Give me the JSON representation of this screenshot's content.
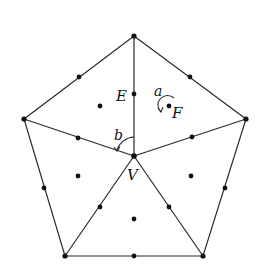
{
  "diagram": {
    "colors": {
      "line": "#2a2a2a",
      "dot": "#111111",
      "background": "#ffffff"
    },
    "outer_vertices": [
      {
        "x": 134,
        "y": 36
      },
      {
        "x": 246,
        "y": 119
      },
      {
        "x": 203,
        "y": 256
      },
      {
        "x": 65,
        "y": 256
      },
      {
        "x": 24,
        "y": 119
      }
    ],
    "center_vertex": {
      "x": 134,
      "y": 156
    },
    "labels": {
      "E": "E",
      "F": "F",
      "V": "V",
      "a": "a",
      "b": "b"
    },
    "edge_midpoints": [
      {
        "x": 79,
        "y": 77
      },
      {
        "x": 190,
        "y": 77
      },
      {
        "x": 225,
        "y": 188
      },
      {
        "x": 134,
        "y": 256
      },
      {
        "x": 44,
        "y": 188
      },
      {
        "x": 134,
        "y": 94
      },
      {
        "x": 192,
        "y": 137
      },
      {
        "x": 169,
        "y": 207
      },
      {
        "x": 100,
        "y": 207
      },
      {
        "x": 78,
        "y": 138
      }
    ],
    "face_centers": [
      {
        "x": 100,
        "y": 106
      },
      {
        "x": 169,
        "y": 106
      },
      {
        "x": 191,
        "y": 176
      },
      {
        "x": 134,
        "y": 219
      },
      {
        "x": 78,
        "y": 176
      }
    ]
  }
}
